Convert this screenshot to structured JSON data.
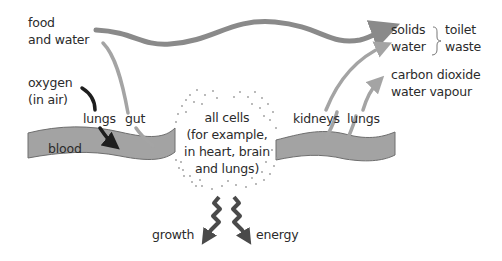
{
  "diagram": {
    "inputs": {
      "food_water": "food\nand water",
      "oxygen": "oxygen\n(in air)"
    },
    "entry_organs": {
      "lungs": "lungs",
      "gut": "gut"
    },
    "blood_label": "blood",
    "cells_label": "all cells\n(for example,\nin heart, brain\nand lungs)",
    "exit_organs": {
      "kidneys": "kidneys",
      "lungs": "lungs"
    },
    "outputs": {
      "solids": "solids",
      "water": "water",
      "toilet_waste": "toilet\nwaste",
      "gases": "carbon dioxide\nwater vapour"
    },
    "products": {
      "growth": "growth",
      "energy": "energy"
    },
    "colors": {
      "arrow_main": "#8a8a8a",
      "arrow_light": "#a4a4a4",
      "oxygen_arrow": "#1e1e1e",
      "blood_fill": "#a3a3a3",
      "blood_stroke": "#6e6e6e",
      "cell_dots": "#9a9a9a",
      "product_arrows": "#4a4a4a"
    }
  }
}
